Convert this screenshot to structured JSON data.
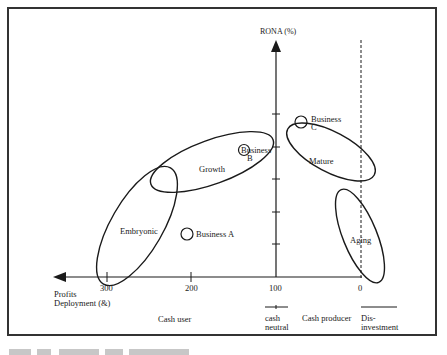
{
  "diagram": {
    "type": "business-life-cycle",
    "y_axis_label": "RONA (%)",
    "x_axis_label_line1": "Profits",
    "x_axis_label_line2": "Deployment (&)",
    "x_ticks": [
      "300",
      "200",
      "100",
      "0"
    ],
    "stages": [
      {
        "name": "Embryonic"
      },
      {
        "name": "Growth"
      },
      {
        "name": "Mature"
      },
      {
        "name": "Aging"
      }
    ],
    "businesses": [
      {
        "line1": "Business A",
        "line2": ""
      },
      {
        "line1": "Business",
        "line2": "B"
      },
      {
        "line1": "Business",
        "line2": "C"
      }
    ],
    "zones": [
      {
        "line1": "Cash user",
        "line2": ""
      },
      {
        "line1": "cash",
        "line2": "neutral"
      },
      {
        "line1": "Cash producer",
        "line2": ""
      },
      {
        "line1": "Dis-",
        "line2": "investment"
      }
    ],
    "colors": {
      "ink": "#1a1a1a",
      "frame": "#333333"
    }
  }
}
